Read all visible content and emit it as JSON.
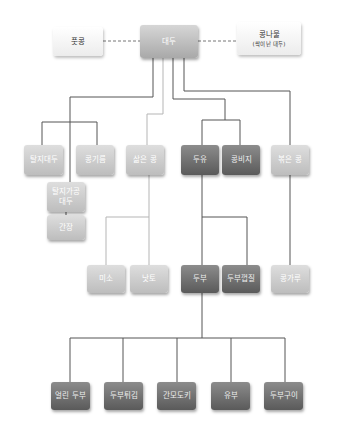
{
  "diagram": {
    "top": {
      "green_soybean": {
        "label": "풋콩"
      },
      "soybean": {
        "label": "대두"
      },
      "bean_sprout": {
        "label": "콩나물",
        "sub": "(싹이 난 대두)"
      }
    },
    "row2": {
      "defatted_soybean": {
        "label": "탈지대두"
      },
      "soybean_oil": {
        "label": "콩기름"
      },
      "boiled_beans": {
        "label": "삶은 콩"
      },
      "soy_milk": {
        "label": "두유"
      },
      "okara": {
        "label": "콩비지"
      },
      "roasted_beans": {
        "label": "볶은 콩"
      }
    },
    "branch": {
      "defatted_processed_soybean": {
        "line1": "탈지가공",
        "line2": "대두"
      },
      "soy_sauce": {
        "label": "간장"
      }
    },
    "row3": {
      "miso": {
        "label": "미소"
      },
      "natto": {
        "label": "낫토"
      },
      "tofu": {
        "label": "두부"
      },
      "tofu_skin": {
        "label": "두부껍질"
      },
      "soybean_flour": {
        "label": "콩가루"
      }
    },
    "row4": {
      "frozen_tofu": {
        "label": "얼린 두부"
      },
      "fried_tofu": {
        "label": "두부튀김"
      },
      "ganmodoki": {
        "label": "간모도키"
      },
      "yuba": {
        "label": "유부"
      },
      "grilled_tofu": {
        "label": "두부구이"
      }
    },
    "colors": {
      "line_dark": "#555555",
      "line_light": "#b5b5b5",
      "box_dark": "#6e6e6e",
      "box_light": "#c8c8c8",
      "box_white": "#f5f5f5"
    }
  }
}
